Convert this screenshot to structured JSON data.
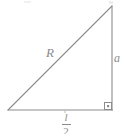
{
  "figure": {
    "type": "geometry-diagram",
    "background_color": "#ffffff",
    "stroke_color": "#8c8c8c",
    "label_color": "#8c8c8c",
    "shape": "right-triangle",
    "vertices": {
      "bottom_left": [
        8,
        110
      ],
      "bottom_right": [
        112,
        110
      ],
      "top_right": [
        112,
        6
      ]
    },
    "sides": [
      {
        "name": "hypotenuse",
        "label": "R",
        "from": [
          8,
          110
        ],
        "to": [
          112,
          6
        ],
        "label_position": [
          46,
          46
        ]
      },
      {
        "name": "vertical-leg",
        "label": "a",
        "from": [
          112,
          6
        ],
        "to": [
          112,
          110
        ],
        "label_position": [
          114,
          52
        ]
      },
      {
        "name": "horizontal-leg",
        "label_numerator": "l",
        "label_denominator": "2",
        "label_text": "l/2",
        "from": [
          8,
          110
        ],
        "to": [
          112,
          110
        ],
        "label_position": [
          58,
          112
        ]
      }
    ],
    "right_angle_marker": {
      "name": "right-angle-square",
      "at": [
        112,
        110
      ],
      "size": 7,
      "has_center_dot": true
    },
    "tick_mark": {
      "name": "base-midpoint-tick",
      "at": [
        65,
        111
      ]
    }
  }
}
